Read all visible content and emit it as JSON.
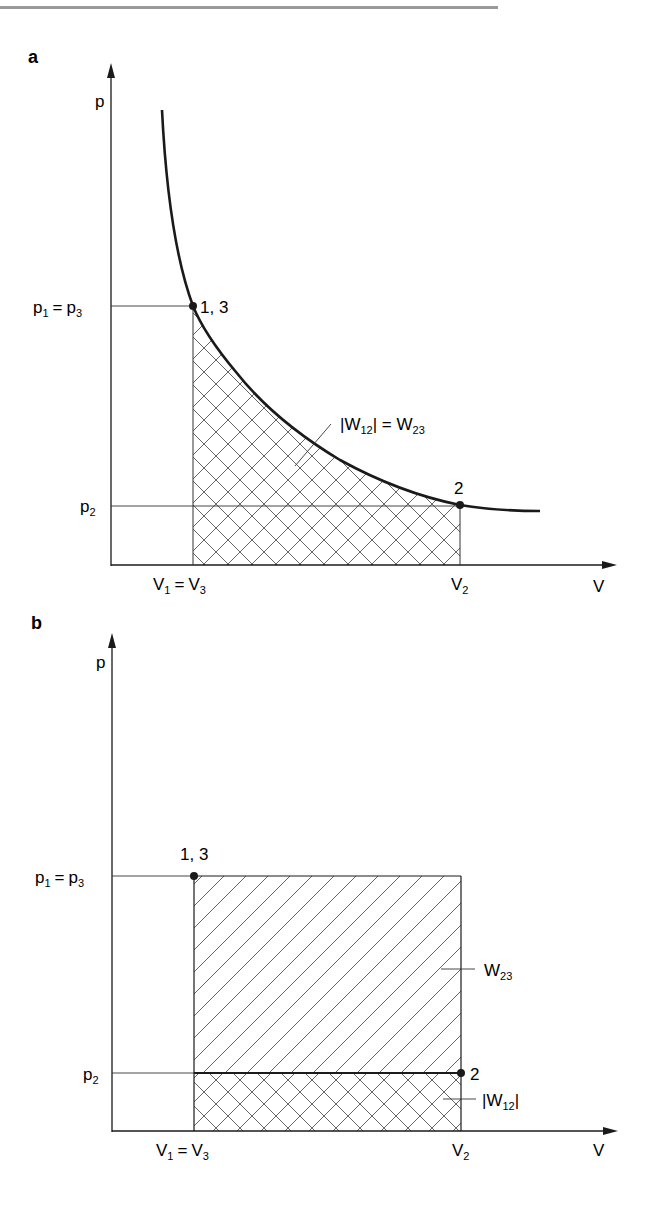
{
  "header": {
    "rule_color": "#9a9a9a"
  },
  "colors": {
    "line": "#1a1a1a",
    "hatch": "#555555",
    "background": "#ffffff"
  },
  "panels": [
    {
      "id": "a",
      "label": "a",
      "y_axis_label": "p",
      "x_axis_label": "V",
      "tick_labels": {
        "p1": {
          "main": "p",
          "sub": "1",
          "eq": "=",
          "main2": "p",
          "sub2": "3"
        },
        "p2": {
          "main": "p",
          "sub": "2"
        },
        "v1": {
          "main": "V",
          "sub": "1",
          "eq": "=",
          "main2": "V",
          "sub2": "3"
        },
        "v2": {
          "main": "V",
          "sub": "2"
        }
      },
      "points": [
        {
          "label": "1, 3"
        },
        {
          "label": "2"
        }
      ],
      "annotation": {
        "text_left": "|W",
        "sub_left": "12",
        "text_mid": "| = W",
        "sub_right": "23"
      },
      "curve": "isothermal hyperbola p·V = const"
    },
    {
      "id": "b",
      "label": "b",
      "y_axis_label": "p",
      "x_axis_label": "V",
      "tick_labels": {
        "p1": {
          "main": "p",
          "sub": "1",
          "eq": "=",
          "main2": "p",
          "sub2": "3"
        },
        "p2": {
          "main": "p",
          "sub": "2"
        },
        "v1": {
          "main": "V",
          "sub": "1",
          "eq": "=",
          "main2": "V",
          "sub2": "3"
        },
        "v2": {
          "main": "V",
          "sub": "2"
        }
      },
      "points": [
        {
          "label": "1, 3"
        },
        {
          "label": "2"
        }
      ],
      "annotations": [
        {
          "text": "W",
          "sub": "23"
        },
        {
          "text": "|W",
          "sub": "12",
          "close": "|"
        }
      ]
    }
  ]
}
